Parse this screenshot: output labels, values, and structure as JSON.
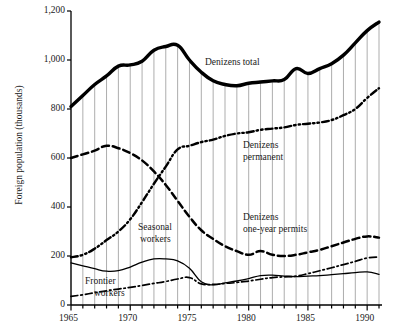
{
  "figure": {
    "ylabel": "Foreign population (thousands)",
    "background": "#ffffff",
    "ink": "#000000",
    "gridline_color": "#8a8a8a"
  },
  "annotations": [
    {
      "name": "denizens-total",
      "text": "Denizens total",
      "x": 205,
      "y": 57
    },
    {
      "name": "denizens-permanent",
      "text": "Denizens",
      "x": 243,
      "y": 140
    },
    {
      "name": "denizens-permanent-2",
      "text": "permanent",
      "x": 243,
      "y": 152
    },
    {
      "name": "denizens-one-year",
      "text": "Denizens",
      "x": 243,
      "y": 212
    },
    {
      "name": "denizens-one-year-2",
      "text": "one-year permits",
      "x": 243,
      "y": 224
    },
    {
      "name": "seasonal-workers",
      "text": "Seasonal",
      "x": 138,
      "y": 222
    },
    {
      "name": "seasonal-workers-2",
      "text": "workers",
      "x": 140,
      "y": 234
    },
    {
      "name": "frontier-workers",
      "text": "Frontier",
      "x": 85,
      "y": 276
    },
    {
      "name": "frontier-workers-2",
      "text": "workers",
      "x": 94,
      "y": 288
    }
  ],
  "chart_data": {
    "type": "line",
    "title": "",
    "xlabel": "",
    "ylabel": "Foreign population (thousands)",
    "xlim": [
      1965,
      1991
    ],
    "ylim": [
      0,
      1200
    ],
    "ytick_values": [
      0,
      200,
      400,
      600,
      800,
      1000,
      1200
    ],
    "ytick_labels": [
      "0",
      "200",
      "400",
      "600",
      "800",
      "1,000",
      "1,200"
    ],
    "xtick_values": [
      1965,
      1970,
      1975,
      1980,
      1985,
      1990
    ],
    "xtick_labels": [
      "1965",
      "1970",
      "1975",
      "1980",
      "1985",
      "1990"
    ],
    "xtick_minor_step": 1,
    "grid": "vertical-dropline-to-total",
    "legend": "inline-annotations",
    "x": [
      1965,
      1966,
      1967,
      1968,
      1969,
      1970,
      1971,
      1972,
      1973,
      1974,
      1975,
      1976,
      1977,
      1978,
      1979,
      1980,
      1981,
      1982,
      1983,
      1984,
      1985,
      1986,
      1987,
      1988,
      1989,
      1990,
      1991
    ],
    "series": [
      {
        "name": "Denizens total",
        "style": "thick-solid",
        "values": [
          810,
          855,
          900,
          935,
          975,
          980,
          995,
          1040,
          1055,
          1060,
          1000,
          950,
          915,
          900,
          895,
          905,
          910,
          915,
          920,
          965,
          945,
          965,
          985,
          1020,
          1070,
          1120,
          1155
        ]
      },
      {
        "name": "Denizens permanent",
        "style": "dash-dot-dot",
        "values": [
          195,
          205,
          230,
          265,
          300,
          350,
          420,
          495,
          565,
          635,
          650,
          665,
          675,
          690,
          700,
          705,
          715,
          720,
          725,
          735,
          740,
          745,
          755,
          775,
          800,
          845,
          885
        ]
      },
      {
        "name": "Denizens one-year permits",
        "style": "long-dash",
        "values": [
          600,
          615,
          630,
          650,
          640,
          620,
          590,
          545,
          490,
          425,
          360,
          305,
          270,
          240,
          220,
          205,
          220,
          205,
          200,
          205,
          215,
          225,
          240,
          255,
          270,
          280,
          275
        ]
      },
      {
        "name": "Seasonal workers",
        "style": "thin-solid",
        "values": [
          172,
          160,
          148,
          138,
          140,
          155,
          175,
          188,
          188,
          180,
          150,
          95,
          82,
          90,
          98,
          108,
          120,
          122,
          118,
          116,
          118,
          120,
          124,
          128,
          132,
          135,
          125
        ]
      },
      {
        "name": "Frontier workers",
        "style": "dash-dot",
        "values": [
          35,
          42,
          50,
          58,
          65,
          72,
          80,
          88,
          96,
          106,
          112,
          86,
          84,
          88,
          92,
          98,
          105,
          112,
          115,
          118,
          128,
          140,
          152,
          165,
          178,
          192,
          196
        ]
      }
    ]
  }
}
